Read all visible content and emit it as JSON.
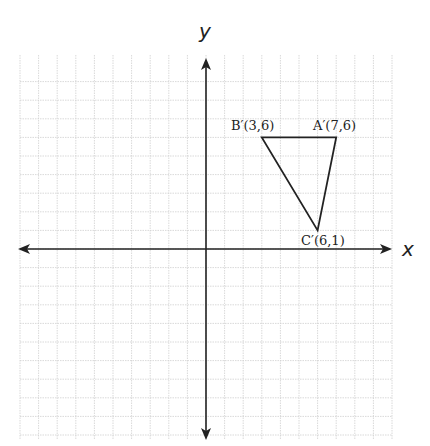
{
  "axes": {
    "x_label": "x",
    "y_label": "y"
  },
  "grid": {
    "xmin": -10,
    "xmax": 10,
    "ymin": -10,
    "ymax": 10,
    "unit_px": 18.6,
    "origin_px": [
      206,
      249
    ]
  },
  "points": [
    {
      "name": "B'",
      "label": "B′(3,6)",
      "x": 3,
      "y": 6
    },
    {
      "name": "A'",
      "label": "A′(7,6)",
      "x": 7,
      "y": 6
    },
    {
      "name": "C'",
      "label": "C′(6,1)",
      "x": 6,
      "y": 1
    }
  ],
  "colors": {
    "grid": "#cfcfcf",
    "axis": "#222222",
    "triangle": "#222222"
  }
}
